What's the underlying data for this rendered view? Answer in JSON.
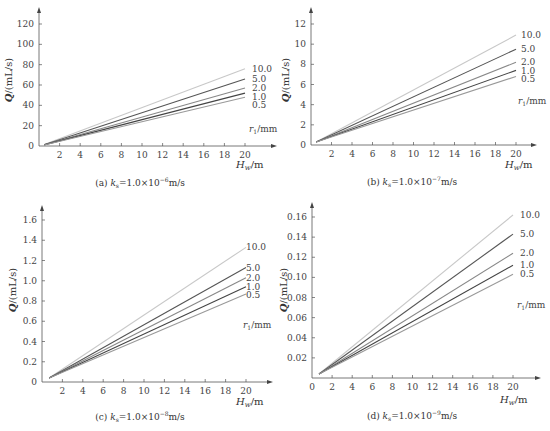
{
  "chart_data": [
    {
      "id": "a",
      "type": "line",
      "caption": "(a) k_s = 1.0×10⁻⁶ m/s",
      "caption_parts": {
        "prefix": "(a) ",
        "k": "k",
        "sub": "s",
        "rest": "=1.0×10",
        "exp": "−6",
        "unit": "m/s"
      },
      "xlabel": "H_w/m",
      "ylabel": "Q/(mL/s)",
      "legend_title": "r₁/mm",
      "xlim": [
        0,
        22
      ],
      "ylim": [
        0,
        125
      ],
      "xticks": [
        2,
        4,
        6,
        8,
        10,
        12,
        14,
        16,
        18,
        20
      ],
      "yticks": [
        0,
        20,
        40,
        60,
        80,
        100,
        120
      ],
      "ytick_labels": [
        "0",
        "20",
        "40",
        "60",
        "80",
        "100",
        "120"
      ],
      "series": [
        {
          "name": "10.0",
          "x": [
            0.5,
            20
          ],
          "values": [
            1.5,
            76
          ],
          "color": "#c8c8c8"
        },
        {
          "name": "5.0",
          "x": [
            0.5,
            20
          ],
          "values": [
            1.3,
            66
          ],
          "color": "#555555"
        },
        {
          "name": "2.0",
          "x": [
            0.5,
            20
          ],
          "values": [
            1.2,
            57
          ],
          "color": "#888888"
        },
        {
          "name": "1.0",
          "x": [
            0.5,
            20
          ],
          "values": [
            1.1,
            52
          ],
          "color": "#444444"
        },
        {
          "name": "0.5",
          "x": [
            0.5,
            20
          ],
          "values": [
            1.0,
            48
          ],
          "color": "#999999"
        }
      ],
      "grid": false
    },
    {
      "id": "b",
      "type": "line",
      "caption": "(b) k_s = 1.0×10⁻⁷ m/s",
      "caption_parts": {
        "prefix": "(b) ",
        "k": "k",
        "sub": "s",
        "rest": "=1.0×10",
        "exp": "−7",
        "unit": "m/s"
      },
      "xlabel": "H_w/m",
      "ylabel": "Q/(mL/s)",
      "legend_title": "r₁/mm",
      "xlim": [
        0,
        22
      ],
      "ylim": [
        0,
        12.5
      ],
      "xticks": [
        2,
        4,
        6,
        8,
        10,
        12,
        14,
        16,
        18,
        20
      ],
      "yticks": [
        0,
        2,
        4,
        6,
        8,
        10,
        12
      ],
      "ytick_labels": [
        "0",
        "2",
        "4",
        "6",
        "8",
        "10",
        "12"
      ],
      "series": [
        {
          "name": "10.0",
          "x": [
            0.5,
            20
          ],
          "values": [
            0.3,
            10.9
          ],
          "color": "#c8c8c8"
        },
        {
          "name": "5.0",
          "x": [
            0.5,
            20
          ],
          "values": [
            0.3,
            9.5
          ],
          "color": "#555555"
        },
        {
          "name": "2.0",
          "x": [
            0.5,
            20
          ],
          "values": [
            0.3,
            8.2
          ],
          "color": "#888888"
        },
        {
          "name": "1.0",
          "x": [
            0.5,
            20
          ],
          "values": [
            0.3,
            7.4
          ],
          "color": "#444444"
        },
        {
          "name": "0.5",
          "x": [
            0.5,
            20
          ],
          "values": [
            0.3,
            6.8
          ],
          "color": "#999999"
        }
      ],
      "grid": false
    },
    {
      "id": "c",
      "type": "line",
      "caption": "(c) k_s = 1.0×10⁻⁸ m/s",
      "caption_parts": {
        "prefix": "(c) ",
        "k": "k",
        "sub": "s",
        "rest": "=1.0×10",
        "exp": "−8",
        "unit": "m/s"
      },
      "xlabel": "H_w/m",
      "ylabel": "Q/(mL/s)",
      "legend_title": "r₁/mm",
      "xlim": [
        0,
        22
      ],
      "ylim": [
        0,
        1.65
      ],
      "xticks": [
        2,
        4,
        6,
        8,
        10,
        12,
        14,
        16,
        18,
        20
      ],
      "yticks": [
        0,
        0.2,
        0.4,
        0.6,
        0.8,
        1.0,
        1.2,
        1.4,
        1.6
      ],
      "ytick_labels": [
        "0",
        "0.2",
        "0.4",
        "0.6",
        "0.8",
        "1.0",
        "1.2",
        "1.4",
        "1.6"
      ],
      "series": [
        {
          "name": "10.0",
          "x": [
            0.7,
            20
          ],
          "values": [
            0.04,
            1.33
          ],
          "color": "#c8c8c8"
        },
        {
          "name": "5.0",
          "x": [
            0.7,
            20
          ],
          "values": [
            0.04,
            1.13
          ],
          "color": "#555555"
        },
        {
          "name": "2.0",
          "x": [
            0.7,
            20
          ],
          "values": [
            0.04,
            1.03
          ],
          "color": "#888888"
        },
        {
          "name": "1.0",
          "x": [
            0.7,
            20
          ],
          "values": [
            0.04,
            0.94
          ],
          "color": "#444444"
        },
        {
          "name": "0.5",
          "x": [
            0.7,
            20
          ],
          "values": [
            0.04,
            0.87
          ],
          "color": "#999999"
        }
      ],
      "grid": false
    },
    {
      "id": "d",
      "type": "line",
      "caption": "(d) k_s = 1.0×10⁻⁹ m/s",
      "caption_parts": {
        "prefix": "(d) ",
        "k": "k",
        "sub": "s",
        "rest": "=1.0×10",
        "exp": "−9",
        "unit": "m/s"
      },
      "xlabel": "H_w/m",
      "ylabel": "Q/(mL/s)",
      "legend_title": "r₁/mm",
      "xlim": [
        0,
        22
      ],
      "ylim": [
        0,
        0.165
      ],
      "xticks": [
        0,
        2,
        4,
        6,
        8,
        10,
        12,
        14,
        16,
        18,
        20
      ],
      "yticks": [
        0.02,
        0.04,
        0.06,
        0.08,
        0.1,
        0.12,
        0.14,
        0.16
      ],
      "ytick_labels": [
        "0.02",
        "0.04",
        "0.06",
        "0.08",
        "0.10",
        "0.12",
        "0.14",
        "0.16"
      ],
      "series": [
        {
          "name": "10.0",
          "x": [
            0.7,
            20
          ],
          "values": [
            0.004,
            0.162
          ],
          "color": "#c8c8c8"
        },
        {
          "name": "5.0",
          "x": [
            0.7,
            20
          ],
          "values": [
            0.004,
            0.143
          ],
          "color": "#555555"
        },
        {
          "name": "2.0",
          "x": [
            0.7,
            20
          ],
          "values": [
            0.004,
            0.124
          ],
          "color": "#888888"
        },
        {
          "name": "1.0",
          "x": [
            0.7,
            20
          ],
          "values": [
            0.004,
            0.112
          ],
          "color": "#444444"
        },
        {
          "name": "0.5",
          "x": [
            0.7,
            20
          ],
          "values": [
            0.004,
            0.103
          ],
          "color": "#999999"
        }
      ],
      "grid": false
    }
  ],
  "layout": [
    {
      "ox": 39,
      "oy": 146,
      "xPer": 10.3,
      "yTopVal": 120,
      "yTopPx": 24,
      "xEnd": 272,
      "yEnd": 12,
      "captionX": 140,
      "captionY": 186,
      "xlabelX": 236,
      "xlabelY": 168,
      "ylabelX": 12,
      "ylabelY": 80,
      "legendX": 252,
      "legendTitleY": 118
    },
    {
      "ox": 311,
      "oy": 145,
      "xPer": 10.25,
      "yTopVal": 12,
      "yTopPx": 24,
      "xEnd": 532,
      "yEnd": 12,
      "captionX": 412,
      "captionY": 185,
      "xlabelX": 505,
      "xlabelY": 168,
      "ylabelX": 289,
      "ylabelY": 80,
      "legendX": 521,
      "legendTitleY": 90
    },
    {
      "ox": 42,
      "oy": 382,
      "xPer": 10.2,
      "yTopVal": 1.6,
      "yTopPx": 220,
      "xEnd": 268,
      "yEnd": 210,
      "captionX": 140,
      "captionY": 420,
      "xlabelX": 236,
      "xlabelY": 405,
      "ylabelX": 16,
      "ylabelY": 290,
      "legendX": 246,
      "legendTitleY": 314
    },
    {
      "ox": 312,
      "oy": 378,
      "xPer": 10.05,
      "yTopVal": 0.16,
      "yTopPx": 217,
      "xEnd": 536,
      "yEnd": 207,
      "captionX": 412,
      "captionY": 419,
      "xlabelX": 500,
      "xlabelY": 403,
      "ylabelX": 287,
      "ylabelY": 290,
      "legendX": 520,
      "legendTitleY": 294
    }
  ]
}
